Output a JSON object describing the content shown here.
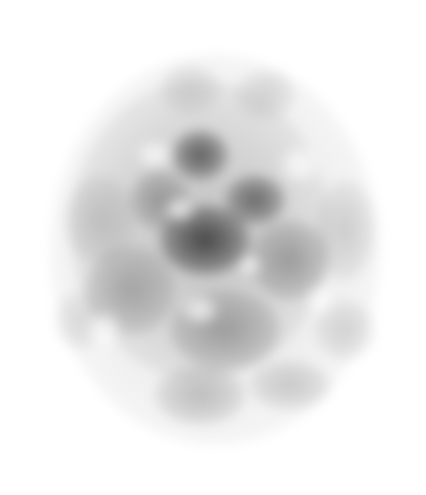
{
  "image": {
    "description": "Soft grayscale cloud-like noise texture centered on a white background",
    "background": "#ffffff",
    "width": 426,
    "height": 495,
    "blobs": [
      {
        "x": 215,
        "y": 250,
        "rx": 165,
        "ry": 195,
        "shade": "#c8c8c8",
        "alpha": 0.55
      },
      {
        "x": 200,
        "y": 230,
        "rx": 130,
        "ry": 150,
        "shade": "#a8a8a8",
        "alpha": 0.55
      },
      {
        "x": 205,
        "y": 240,
        "rx": 45,
        "ry": 35,
        "shade": "#303030",
        "alpha": 0.85
      },
      {
        "x": 200,
        "y": 155,
        "rx": 28,
        "ry": 25,
        "shade": "#404040",
        "alpha": 0.8
      },
      {
        "x": 255,
        "y": 200,
        "rx": 30,
        "ry": 25,
        "shade": "#454545",
        "alpha": 0.75
      },
      {
        "x": 160,
        "y": 200,
        "rx": 30,
        "ry": 30,
        "shade": "#707070",
        "alpha": 0.6
      },
      {
        "x": 290,
        "y": 260,
        "rx": 40,
        "ry": 40,
        "shade": "#6a6a6a",
        "alpha": 0.55
      },
      {
        "x": 130,
        "y": 290,
        "rx": 45,
        "ry": 45,
        "shade": "#7a7a7a",
        "alpha": 0.55
      },
      {
        "x": 225,
        "y": 330,
        "rx": 55,
        "ry": 40,
        "shade": "#6e6e6e",
        "alpha": 0.55
      },
      {
        "x": 200,
        "y": 395,
        "rx": 45,
        "ry": 30,
        "shade": "#8a8a8a",
        "alpha": 0.5
      },
      {
        "x": 290,
        "y": 385,
        "rx": 40,
        "ry": 25,
        "shade": "#959595",
        "alpha": 0.45
      },
      {
        "x": 100,
        "y": 220,
        "rx": 35,
        "ry": 45,
        "shade": "#999999",
        "alpha": 0.45
      },
      {
        "x": 345,
        "y": 230,
        "rx": 30,
        "ry": 50,
        "shade": "#a0a0a0",
        "alpha": 0.45
      },
      {
        "x": 190,
        "y": 90,
        "rx": 30,
        "ry": 25,
        "shade": "#b0b0b0",
        "alpha": 0.5
      },
      {
        "x": 265,
        "y": 95,
        "rx": 30,
        "ry": 25,
        "shade": "#b0b0b0",
        "alpha": 0.5
      },
      {
        "x": 345,
        "y": 330,
        "rx": 30,
        "ry": 30,
        "shade": "#a8a8a8",
        "alpha": 0.45
      },
      {
        "x": 80,
        "y": 320,
        "rx": 25,
        "ry": 30,
        "shade": "#b5b5b5",
        "alpha": 0.45
      }
    ],
    "highlights": [
      {
        "x": 155,
        "y": 155,
        "rx": 18,
        "ry": 14
      },
      {
        "x": 180,
        "y": 210,
        "rx": 15,
        "ry": 12
      },
      {
        "x": 300,
        "y": 165,
        "rx": 20,
        "ry": 18
      },
      {
        "x": 200,
        "y": 310,
        "rx": 18,
        "ry": 14
      },
      {
        "x": 105,
        "y": 330,
        "rx": 16,
        "ry": 18
      },
      {
        "x": 250,
        "y": 265,
        "rx": 12,
        "ry": 10
      },
      {
        "x": 320,
        "y": 300,
        "rx": 14,
        "ry": 16
      }
    ]
  }
}
